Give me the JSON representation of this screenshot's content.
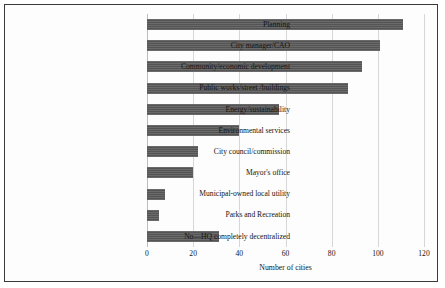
{
  "chart_data": {
    "type": "bar",
    "orientation": "horizontal",
    "title": "",
    "xlabel": "Number of cities",
    "ylabel": "",
    "xlim": [
      0,
      120
    ],
    "xticks": [
      0,
      20,
      40,
      60,
      80,
      100,
      120
    ],
    "grid": "vertical",
    "legend": "none",
    "bar_color": "#595959",
    "categories": [
      "Planning",
      "City manager/CAO",
      "Community/economic development",
      "Public works/street /buildings",
      "Energy/sustainability",
      "Environmental services",
      "City council/commission",
      "Mayor's office",
      "Municipal-owned local utility",
      "Parks and Recreation",
      "No—HQ completely decentralized"
    ],
    "values": [
      111,
      101,
      93,
      87,
      57,
      40,
      22,
      20,
      8,
      5,
      31
    ]
  }
}
